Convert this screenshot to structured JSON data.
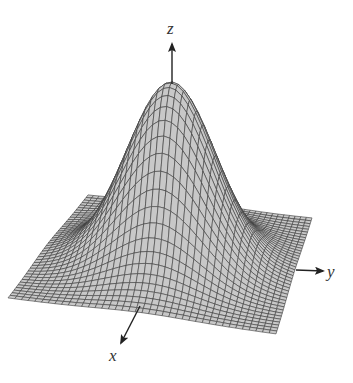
{
  "figure": {
    "title": "",
    "surface": {
      "function": "z = exp(-(x^2 + y^2))",
      "grid_lines_per_side": 40,
      "domain": [
        -2,
        2
      ],
      "fill_color": "#c8c8c8",
      "line_color": "#3a3a3a"
    },
    "axes": {
      "x": {
        "label": "x",
        "arrow": "front-left (toward viewer)"
      },
      "y": {
        "label": "y",
        "arrow": "right"
      },
      "z": {
        "label": "z",
        "arrow": "up"
      },
      "color": "#222222"
    }
  },
  "projection": {
    "base_corners_px": {
      "back": [
        88,
        195
      ],
      "right": [
        312,
        218
      ],
      "front": [
        276,
        334
      ],
      "left": [
        8,
        298
      ]
    },
    "peak_px": [
      172,
      83
    ],
    "z_scale_px": 160
  },
  "labels": {
    "z": "z",
    "y": "y",
    "x": "x"
  }
}
